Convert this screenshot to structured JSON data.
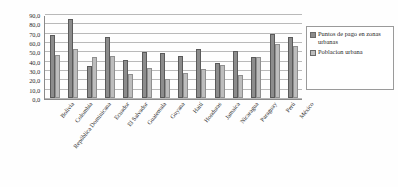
{
  "chart_data": {
    "type": "bar",
    "title": "",
    "xlabel": "",
    "ylabel": "",
    "ylim": [
      0,
      90
    ],
    "ytick_step": 10,
    "grid": true,
    "legend_position": "right",
    "ytick_labels": [
      "90,0",
      "80,0",
      "70,0",
      "60,0",
      "50,0",
      "40,0",
      "30,0",
      "20,0",
      "10,0",
      "0,0"
    ],
    "categories": [
      "Bolivia",
      "Colombia",
      "República Dominicana",
      "Ecuador",
      "El Salvador",
      "Guatemala",
      "Guyana",
      "Haití",
      "Honduras",
      "Jamaica",
      "Nicaragua",
      "Paraguay",
      "Perú",
      "México"
    ],
    "series": [
      {
        "name": "Puntos de pago en zonas urbanas",
        "color": "#8c8c8c",
        "values": [
          68.0,
          85.0,
          34.0,
          65.0,
          41.0,
          49.0,
          48.0,
          45.0,
          53.0,
          38.0,
          50.0,
          44.0,
          69.0,
          65.0
        ]
      },
      {
        "name": "Población urbana",
        "color": "#bdbdbd",
        "values": [
          46.0,
          52.0,
          44.0,
          45.0,
          26.0,
          32.0,
          20.0,
          27.0,
          31.0,
          35.0,
          25.0,
          44.0,
          58.0,
          56.0
        ]
      }
    ]
  },
  "legend": {
    "entries": [
      "Puntos de pago en zonas urbanas",
      "Poblacion urbana"
    ]
  }
}
